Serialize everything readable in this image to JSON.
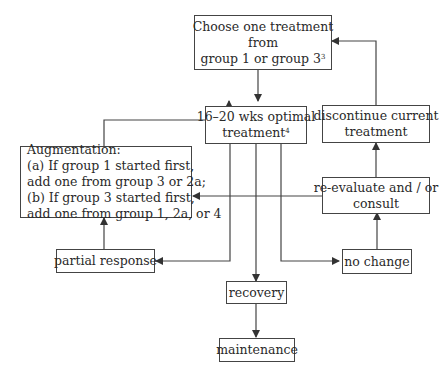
{
  "diagram": {
    "nodes": {
      "choose": {
        "lines": [
          "Choose one treatment",
          "from",
          "group 1 or group 3"
        ],
        "superscript": "3"
      },
      "optimal": {
        "lines": [
          "16–20 wks optimal",
          "treatment"
        ],
        "superscript": "4"
      },
      "discontinue": {
        "lines": [
          "discontinue current",
          "treatment"
        ]
      },
      "augmentation": {
        "lines": [
          "Augmentation:",
          "(a) If group 1 started first,",
          "add one from group 3 or 2a;",
          "(b) If group 3 started first,",
          "add one from group 1, 2a, or 4"
        ]
      },
      "reevaluate": {
        "lines": [
          "re-evaluate and / or",
          "consult"
        ]
      },
      "partial": {
        "lines": [
          "partial response"
        ]
      },
      "nochange": {
        "lines": [
          "no change"
        ]
      },
      "recovery": {
        "lines": [
          "recovery"
        ]
      },
      "maintenance": {
        "lines": [
          "maintenance"
        ]
      }
    },
    "edges": [
      {
        "from": "choose",
        "to": "optimal"
      },
      {
        "from": "augmentation",
        "to": "optimal"
      },
      {
        "from": "optimal",
        "to": "partial"
      },
      {
        "from": "optimal",
        "to": "recovery"
      },
      {
        "from": "optimal",
        "to": "nochange"
      },
      {
        "from": "optimal",
        "to": "augmentation"
      },
      {
        "from": "partial",
        "to": "augmentation"
      },
      {
        "from": "nochange",
        "to": "reevaluate"
      },
      {
        "from": "reevaluate",
        "to": "discontinue"
      },
      {
        "from": "reevaluate",
        "to": "augmentation"
      },
      {
        "from": "discontinue",
        "to": "choose"
      },
      {
        "from": "recovery",
        "to": "maintenance"
      }
    ]
  }
}
